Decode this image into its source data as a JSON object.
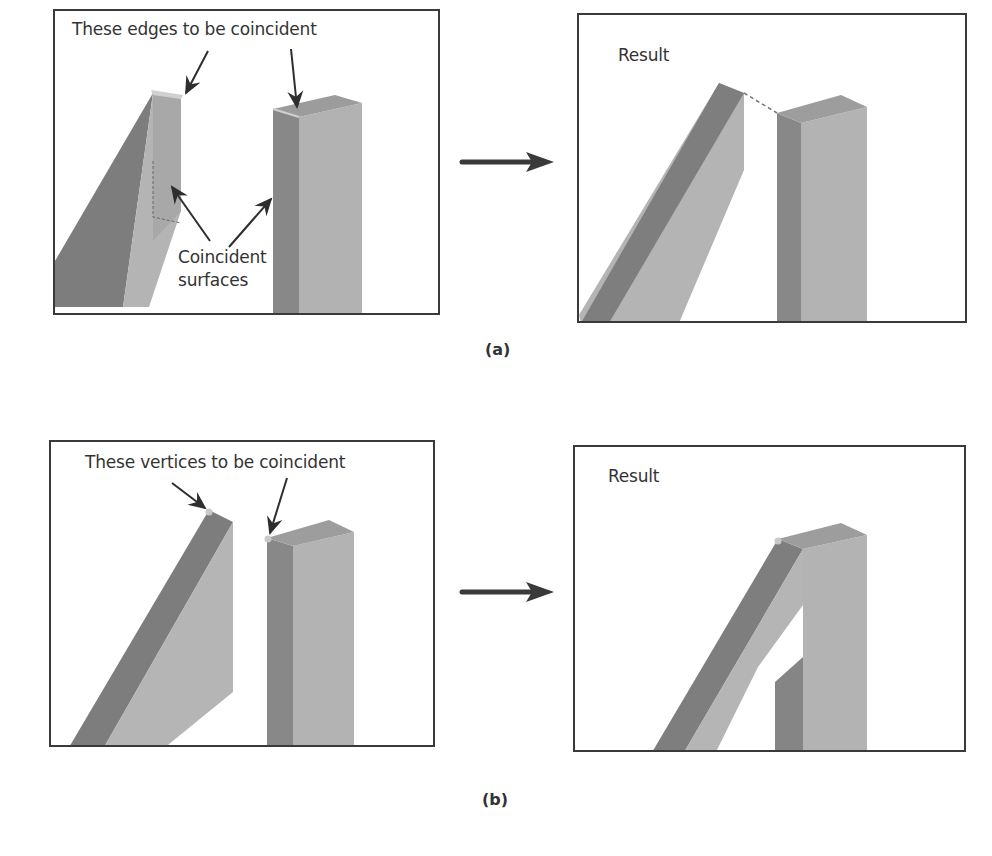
{
  "figure_a": {
    "caption": "(a)",
    "before": {
      "label_top": "These edges to be coincident",
      "label_bottom_line1": "Coincident",
      "label_bottom_line2": "surfaces"
    },
    "after": {
      "label": "Result"
    }
  },
  "figure_b": {
    "caption": "(b)",
    "before": {
      "label_top": "These vertices to be coincident"
    },
    "after": {
      "label": "Result"
    }
  },
  "colors": {
    "border": "#3a3a3a",
    "beam_dark": "#7a7a7a",
    "beam_mid": "#9b9b9b",
    "beam_light": "#b8b8b8",
    "beam_top": "#a6a6a6",
    "arrow": "#3a3a3a",
    "vertex_marker": "#c8c8c8"
  }
}
